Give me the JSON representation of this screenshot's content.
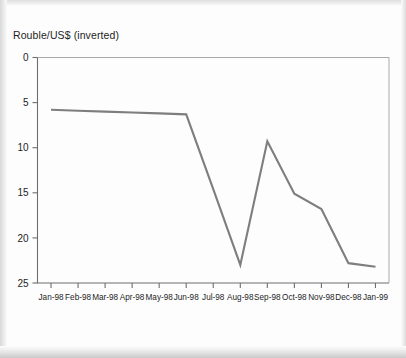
{
  "chart_title": "Rouble/US$ (inverted)",
  "axis": {
    "y_ticks": [
      "0",
      "5",
      "10",
      "15",
      "20",
      "25"
    ],
    "x_ticks": [
      "Jan-98",
      "Feb-98",
      "Mar-98",
      "Apr-98",
      "May-98",
      "Jun-98",
      "Jul-98",
      "Aug-98",
      "Sep-98",
      "Oct-98",
      "Nov-98",
      "Dec-98",
      "Jan-99"
    ]
  },
  "colors": {
    "line": "#7e7e7e",
    "axis": "#6e6e6e",
    "frame": "#a9a9a9",
    "text": "#1d1d1d",
    "background": "#fdfdfd"
  },
  "chart_data": {
    "type": "line",
    "title": "Rouble/US$ (inverted)",
    "xlabel": "",
    "ylabel": "Rouble/US$ (inverted)",
    "y_inverted": true,
    "ylim": [
      0,
      25
    ],
    "grid": false,
    "legend": "none",
    "categories": [
      "Jan-98",
      "Feb-98",
      "Mar-98",
      "Apr-98",
      "May-98",
      "Jun-98",
      "Jul-98",
      "Aug-98",
      "Sep-98",
      "Oct-98",
      "Nov-98",
      "Dec-98",
      "Jan-99"
    ],
    "series": [
      {
        "name": "Rouble/US$",
        "values": [
          5.8,
          5.9,
          6.0,
          6.1,
          6.2,
          6.3,
          14.6,
          23.0,
          9.3,
          15.1,
          16.8,
          22.8,
          23.2
        ]
      }
    ]
  }
}
